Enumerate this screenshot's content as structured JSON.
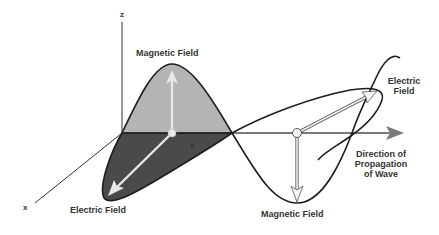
{
  "diagram": {
    "type": "electromagnetic-wave",
    "axes": {
      "z_label": "z",
      "y_label": "y",
      "x_label": "x"
    },
    "labels": {
      "magnetic_field_top": "Magnetic Field",
      "magnetic_field_bottom": "Magnetic Field",
      "electric_field_bottom": "Electric Field",
      "electric_field_right_line1": "Electric",
      "electric_field_right_line2": "Field",
      "propagation_line1": "Direction of",
      "propagation_line2": "Propagation",
      "propagation_line3": "of Wave"
    },
    "colors": {
      "magnetic_lobe_fill": "#b4b4b4",
      "electric_lobe_fill": "#4a4a4a",
      "curve_stroke": "#1e1e1e",
      "propagation_arrow": "#7a7a7a",
      "vector_arrow": "#e8e8e8",
      "text": "#333333"
    }
  }
}
